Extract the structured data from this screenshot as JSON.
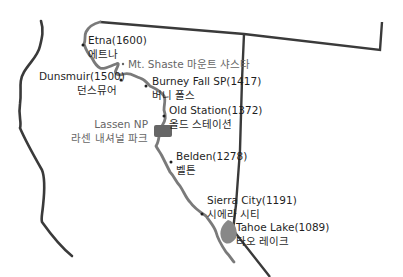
{
  "map": {
    "colors": {
      "background": "#ffffff",
      "border_line": "#3a3a3a",
      "trail_line": "#7a7a7a",
      "park_fill": "#666666",
      "lake_fill": "#888888",
      "text": "#1f1f1f",
      "muted_text": "#666666"
    },
    "places": [
      {
        "name": "Etna(1600)",
        "korean": "에트나"
      },
      {
        "name": "Mt. Shaste 마운트 샤스타"
      },
      {
        "name": "Dunsmuir(1500)",
        "korean": "던스뮤어"
      },
      {
        "name": "Burney Fall SP(1417)",
        "korean": "버니 폴스"
      },
      {
        "name": "Old Station(1372)",
        "korean": "올드 스테이션"
      },
      {
        "name": "Lassen NP",
        "korean": "라센 내셔널 파크"
      },
      {
        "name": "Belden(1278)",
        "korean": "벨튼"
      },
      {
        "name": "Sierra City(1191)",
        "korean": "시에라 시티"
      },
      {
        "name": "Tahoe Lake(1089)",
        "korean": "타오 레이크"
      }
    ]
  }
}
